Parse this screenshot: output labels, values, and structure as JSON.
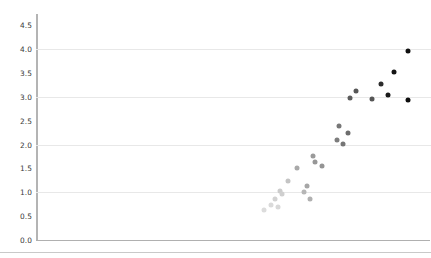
{
  "chart_data": {
    "type": "scatter",
    "title": "",
    "xlabel": "",
    "ylabel": "",
    "xlim": [
      0,
      100
    ],
    "ylim": [
      0.0,
      4.75
    ],
    "grid": true,
    "legend": null,
    "yticks": [
      "0.0",
      "0.5",
      "1.0",
      "1.5",
      "2.0",
      "2.5",
      "3.0",
      "3.5",
      "4.0",
      "4.5"
    ],
    "ytick_values": [
      0.0,
      0.5,
      1.0,
      1.5,
      2.0,
      2.5,
      3.0,
      3.5,
      4.0,
      4.5
    ],
    "gridline_values": [
      1.0,
      2.0,
      3.0,
      4.0
    ],
    "marker": "circle",
    "marker_size": 5,
    "colormap": "grayscale-by-value",
    "series": [
      {
        "name": "points",
        "points": [
          {
            "x": 57.9,
            "y": 0.63,
            "color": "#dcdcdc"
          },
          {
            "x": 59.9,
            "y": 0.74,
            "color": "#dadada"
          },
          {
            "x": 60.8,
            "y": 0.86,
            "color": "#d2d2d2"
          },
          {
            "x": 61.5,
            "y": 0.7,
            "color": "#d8d8d8"
          },
          {
            "x": 62.2,
            "y": 1.02,
            "color": "#cccccc"
          },
          {
            "x": 62.6,
            "y": 0.96,
            "color": "#cfcfcf"
          },
          {
            "x": 64.1,
            "y": 1.24,
            "color": "#c4c4c4"
          },
          {
            "x": 66.5,
            "y": 1.5,
            "color": "#a9a9a9"
          },
          {
            "x": 68.2,
            "y": 1.0,
            "color": "#b6b6b6"
          },
          {
            "x": 68.9,
            "y": 1.13,
            "color": "#a6a6a6"
          },
          {
            "x": 69.6,
            "y": 0.86,
            "color": "#b0b0b0"
          },
          {
            "x": 70.4,
            "y": 1.76,
            "color": "#9a9a9a"
          },
          {
            "x": 70.9,
            "y": 1.63,
            "color": "#979797"
          },
          {
            "x": 72.9,
            "y": 1.55,
            "color": "#949494"
          },
          {
            "x": 76.6,
            "y": 2.1,
            "color": "#7d7d7d"
          },
          {
            "x": 77.2,
            "y": 2.38,
            "color": "#777777"
          },
          {
            "x": 78.1,
            "y": 2.02,
            "color": "#757575"
          },
          {
            "x": 79.3,
            "y": 2.25,
            "color": "#6d6d6d"
          },
          {
            "x": 79.9,
            "y": 2.97,
            "color": "#5c5c5c"
          },
          {
            "x": 81.5,
            "y": 3.12,
            "color": "#575757"
          },
          {
            "x": 85.4,
            "y": 2.95,
            "color": "#555555"
          },
          {
            "x": 87.8,
            "y": 3.28,
            "color": "#2c2c2c"
          },
          {
            "x": 89.5,
            "y": 3.03,
            "color": "#1a1a1a"
          },
          {
            "x": 91.2,
            "y": 3.53,
            "color": "#141414"
          },
          {
            "x": 94.6,
            "y": 3.96,
            "color": "#101010"
          },
          {
            "x": 94.6,
            "y": 2.93,
            "color": "#0d0d0d"
          }
        ]
      }
    ]
  },
  "axis": {
    "y_tick_labels": [
      {
        "text": "4.5",
        "value": 4.5
      },
      {
        "text": "4.0",
        "value": 4.0
      },
      {
        "text": "3.5",
        "value": 3.5
      },
      {
        "text": "3.0",
        "value": 3.0
      },
      {
        "text": "2.5",
        "value": 2.5
      },
      {
        "text": "2.0",
        "value": 2.0
      },
      {
        "text": "1.5",
        "value": 1.5
      },
      {
        "text": "1.0",
        "value": 1.0
      },
      {
        "text": "0.5",
        "value": 0.5
      },
      {
        "text": "0.0",
        "value": 0.0
      }
    ]
  },
  "colors": {
    "background": "#ffffff",
    "gridline": "#e8e8e8",
    "axis_spine": "#b4b4b4",
    "tick_text": "#3a3a3a",
    "bottom_rule": "#c9c9c9"
  }
}
